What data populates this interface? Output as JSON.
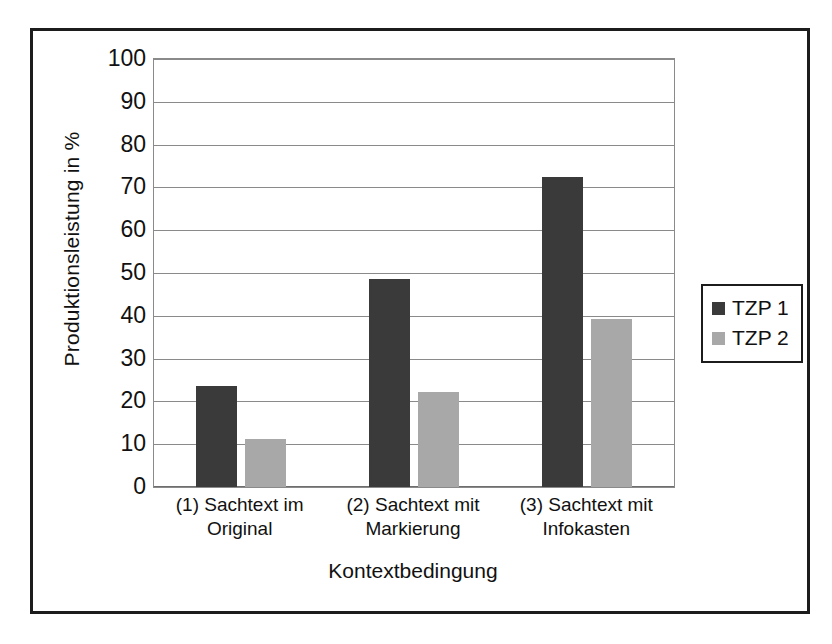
{
  "figure": {
    "border_color": "#1c1c1c",
    "background": "#ffffff"
  },
  "chart_data": {
    "type": "bar",
    "title": "",
    "subtitle": "",
    "xlabel": "Kontextbedingung",
    "ylabel": "Produktionsleistung in %",
    "categories": [
      "(1) Sachtext im Original",
      "(2) Sachtext mit Markierung",
      "(3) Sachtext mit Infokasten"
    ],
    "category_lines": [
      [
        "(1) Sachtext im",
        "Original"
      ],
      [
        "(2) Sachtext mit",
        "Markierung"
      ],
      [
        "(3) Sachtext mit",
        "Infokasten"
      ]
    ],
    "series": [
      {
        "name": "TZP 1",
        "color": "#3a3a3a",
        "values": [
          23.6,
          48.7,
          72.5
        ]
      },
      {
        "name": "TZP 2",
        "color": "#a8a8a8",
        "values": [
          11.3,
          22.3,
          39.2
        ]
      }
    ],
    "ylim": [
      0,
      100
    ],
    "ytick_step": 10,
    "yticks": [
      100,
      90,
      80,
      70,
      60,
      50,
      40,
      30,
      20,
      10,
      0
    ],
    "ytick_labels": [
      "100",
      "90",
      "80",
      "70",
      "60",
      "50",
      "40",
      "30",
      "20",
      "10",
      "0"
    ],
    "grid": "horizontal",
    "legend_position": "right",
    "legend_entries": [
      "TZP 1",
      "TZP 2"
    ]
  }
}
